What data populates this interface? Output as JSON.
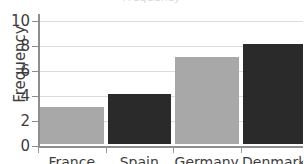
{
  "chart_data": {
    "type": "bar",
    "title": "",
    "xlabel": "",
    "ylabel": "Frequency",
    "categories": [
      "France",
      "Spain",
      "Germany",
      "Denmark"
    ],
    "values": [
      3,
      4,
      7,
      8
    ],
    "series": [
      {
        "name": "Frequency",
        "values": [
          3,
          4,
          7,
          8
        ]
      }
    ],
    "bar_colors": [
      "#a8a8a8",
      "#2a2a2a",
      "#a8a8a8",
      "#2a2a2a"
    ],
    "ylim": [
      0,
      10
    ],
    "ytick_labels": [
      "0",
      "2",
      "4",
      "6",
      "8",
      "10"
    ],
    "ytick_values": [
      0,
      2,
      4,
      6,
      8,
      10
    ],
    "grid": true,
    "grid_axis": "y",
    "legend": false,
    "legend_position": "none"
  },
  "colors": {
    "bar_light": "#a8a8a8",
    "bar_dark": "#2a2a2a",
    "gridline": "#dcdcdc",
    "axis": "#8e8e8e",
    "text": "#3d3d3d",
    "background": "#ffffff"
  },
  "title_remnant": "Frequency",
  "axis": {
    "y_caption": "Frequency"
  }
}
